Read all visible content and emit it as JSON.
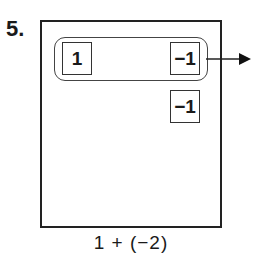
{
  "problem": {
    "number_label": "5.",
    "expression": "1 + (−2)"
  },
  "diagram": {
    "grouped_tiles": [
      {
        "value": "1"
      },
      {
        "value": "−1"
      }
    ],
    "loose_tiles": [
      {
        "value": "−1"
      }
    ],
    "arrow": "arrow-right-icon",
    "colors": {
      "stroke": "#222222",
      "background": "#ffffff"
    }
  }
}
